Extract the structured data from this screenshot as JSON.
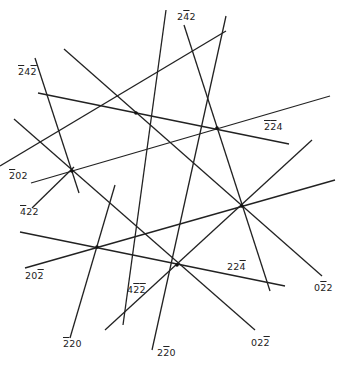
{
  "diagram": {
    "type": "kikuchi-line-map",
    "background": "#ffffff",
    "line_color": "#222222",
    "nodes": [
      {
        "id": "P1",
        "x": 136,
        "y": 113
      },
      {
        "id": "P2",
        "x": 217,
        "y": 128
      },
      {
        "id": "P3",
        "x": 72,
        "y": 171
      },
      {
        "id": "P4",
        "x": 242,
        "y": 206
      },
      {
        "id": "P5",
        "x": 97,
        "y": 247
      },
      {
        "id": "P6",
        "x": 177,
        "y": 265
      }
    ],
    "lines": [
      {
        "x1": 166,
        "y1": 10,
        "x2": 123,
        "y2": 325
      },
      {
        "x1": 35,
        "y1": 58,
        "x2": 79,
        "y2": 193
      },
      {
        "x1": 38,
        "y1": 93,
        "x2": 289,
        "y2": 144
      },
      {
        "x1": 64,
        "y1": 49,
        "x2": 322,
        "y2": 276
      },
      {
        "x1": 226,
        "y1": 16,
        "x2": 152,
        "y2": 350
      },
      {
        "x1": 226,
        "y1": 31,
        "x2": 0,
        "y2": 166
      },
      {
        "x1": 14,
        "y1": 119,
        "x2": 255,
        "y2": 330
      },
      {
        "x1": 31,
        "y1": 183,
        "x2": 330,
        "y2": 96
      },
      {
        "x1": 184,
        "y1": 25,
        "x2": 270,
        "y2": 291
      },
      {
        "x1": 20,
        "y1": 232,
        "x2": 285,
        "y2": 286
      },
      {
        "x1": 25,
        "y1": 268,
        "x2": 335,
        "y2": 180
      },
      {
        "x1": 32,
        "y1": 208,
        "x2": 74,
        "y2": 167
      },
      {
        "x1": 105,
        "y1": 330,
        "x2": 312,
        "y2": 140
      },
      {
        "x1": 70,
        "y1": 338,
        "x2": 115,
        "y2": 185
      }
    ],
    "labels": [
      {
        "id": "lbl-242-top",
        "x": 177,
        "y": 12,
        "parts": [
          {
            "t": "2"
          },
          {
            "t": "4",
            "bar": true
          },
          {
            "t": "2"
          }
        ]
      },
      {
        "id": "lbl-242-left",
        "x": 18,
        "y": 67,
        "parts": [
          {
            "t": "2",
            "bar": true
          },
          {
            "t": "4"
          },
          {
            "t": "2",
            "bar": true
          }
        ]
      },
      {
        "id": "lbl-224-right",
        "x": 264,
        "y": 122,
        "parts": [
          {
            "t": "2",
            "bar": true
          },
          {
            "t": "2",
            "bar": true
          },
          {
            "t": "4"
          }
        ]
      },
      {
        "id": "lbl-202-left",
        "x": 9,
        "y": 171,
        "parts": [
          {
            "t": "2",
            "bar": true
          },
          {
            "t": "0"
          },
          {
            "t": "2"
          }
        ]
      },
      {
        "id": "lbl-422-left",
        "x": 20,
        "y": 207,
        "parts": [
          {
            "t": "4",
            "bar": true
          },
          {
            "t": "2"
          },
          {
            "t": "2"
          }
        ]
      },
      {
        "id": "lbl-202-bot",
        "x": 25,
        "y": 271,
        "parts": [
          {
            "t": "2"
          },
          {
            "t": "0"
          },
          {
            "t": "2",
            "bar": true
          }
        ]
      },
      {
        "id": "lbl-422-bot",
        "x": 127,
        "y": 285,
        "parts": [
          {
            "t": "4"
          },
          {
            "t": "2",
            "bar": true
          },
          {
            "t": "2",
            "bar": true
          }
        ]
      },
      {
        "id": "lbl-224-bot",
        "x": 227,
        "y": 262,
        "parts": [
          {
            "t": "2"
          },
          {
            "t": "2"
          },
          {
            "t": "4",
            "bar": true
          }
        ]
      },
      {
        "id": "lbl-022-right",
        "x": 314,
        "y": 283,
        "parts": [
          {
            "t": "0"
          },
          {
            "t": "2",
            "bar": true
          },
          {
            "t": "2"
          }
        ]
      },
      {
        "id": "lbl-220-left",
        "x": 63,
        "y": 339,
        "parts": [
          {
            "t": "2",
            "bar": true
          },
          {
            "t": "2"
          },
          {
            "t": "0"
          }
        ]
      },
      {
        "id": "lbl-220-bot",
        "x": 157,
        "y": 348,
        "parts": [
          {
            "t": "2"
          },
          {
            "t": "2",
            "bar": true
          },
          {
            "t": "0"
          }
        ]
      },
      {
        "id": "lbl-022-bot",
        "x": 251,
        "y": 338,
        "parts": [
          {
            "t": "0"
          },
          {
            "t": "2"
          },
          {
            "t": "2",
            "bar": true
          }
        ]
      }
    ]
  }
}
